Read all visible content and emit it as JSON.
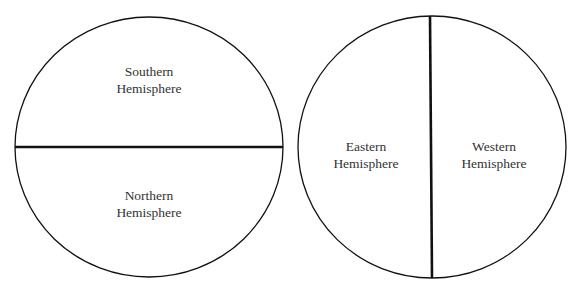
{
  "diagram": {
    "left_globe": {
      "top_label": [
        "Southern",
        "Hemisphere"
      ],
      "bottom_label": [
        "Northern",
        "Hemisphere"
      ],
      "divider": "horizontal"
    },
    "right_globe": {
      "left_label": [
        "Eastern",
        "Hemisphere"
      ],
      "right_label": [
        "Western",
        "Hemisphere"
      ],
      "divider": "vertical"
    },
    "colors": {
      "stroke": "#111111",
      "text": "#333333",
      "background": "#ffffff"
    }
  }
}
